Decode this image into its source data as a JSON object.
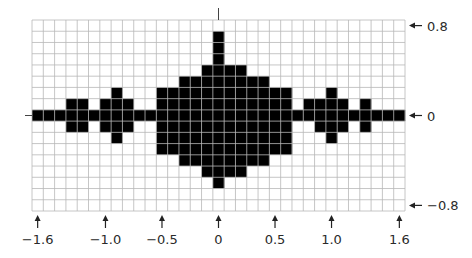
{
  "chart_data": {
    "type": "heatmap",
    "title": "",
    "xlabel": "",
    "ylabel": "",
    "x_range": [
      -1.6,
      1.6
    ],
    "y_range": [
      -0.8,
      0.8
    ],
    "x_step": 0.1,
    "y_step": 0.1,
    "grid": true,
    "columns": 33,
    "rows": 17,
    "x_ticks": [
      {
        "value": -1.6,
        "label": "−1.6"
      },
      {
        "value": -1.0,
        "label": "−1.0"
      },
      {
        "value": -0.5,
        "label": "−0.5"
      },
      {
        "value": 0,
        "label": "0"
      },
      {
        "value": 0.5,
        "label": "0.5"
      },
      {
        "value": 1.0,
        "label": "1.0"
      },
      {
        "value": 1.6,
        "label": "1.6"
      }
    ],
    "y_ticks": [
      {
        "value": 0.8,
        "label": "0.8"
      },
      {
        "value": 0,
        "label": "0"
      },
      {
        "value": -0.8,
        "label": "−0.8"
      }
    ],
    "filled_rows_by_column": [
      [
        8,
        8
      ],
      [
        8,
        8
      ],
      [
        8,
        8
      ],
      [
        7,
        9
      ],
      [
        7,
        9
      ],
      [
        8,
        8
      ],
      [
        7,
        9
      ],
      [
        6,
        10
      ],
      [
        7,
        9
      ],
      [
        8,
        8
      ],
      [
        8,
        8
      ],
      [
        6,
        11
      ],
      [
        6,
        11
      ],
      [
        5,
        12
      ],
      [
        5,
        12
      ],
      [
        4,
        13
      ],
      [
        1,
        14
      ],
      [
        4,
        13
      ],
      [
        4,
        13
      ],
      [
        5,
        12
      ],
      [
        5,
        12
      ],
      [
        6,
        11
      ],
      [
        6,
        11
      ],
      [
        8,
        8
      ],
      [
        7,
        8
      ],
      [
        7,
        9
      ],
      [
        6,
        10
      ],
      [
        7,
        9
      ],
      [
        8,
        8
      ],
      [
        7,
        9
      ],
      [
        8,
        8
      ],
      [
        8,
        8
      ],
      [
        8,
        8
      ]
    ],
    "fill_color": "#000000",
    "grid_color": "#b8b8b8"
  }
}
